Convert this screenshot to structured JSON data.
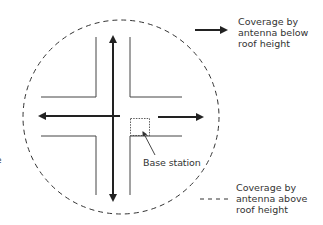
{
  "diagram": {
    "type": "street-microcell-coverage",
    "labels": {
      "base_station": "Base station",
      "edge_fragment": "e"
    },
    "legend": [
      {
        "symbol": "solid-arrow",
        "lines": [
          "Coverage by",
          "antenna below",
          "roof height"
        ]
      },
      {
        "symbol": "dashed-line",
        "lines": [
          "Coverage by",
          "antenna above",
          "roof height"
        ]
      }
    ],
    "colors": {
      "stroke": "#222222",
      "street": "#444444",
      "text": "#333333",
      "background": "#ffffff"
    }
  }
}
